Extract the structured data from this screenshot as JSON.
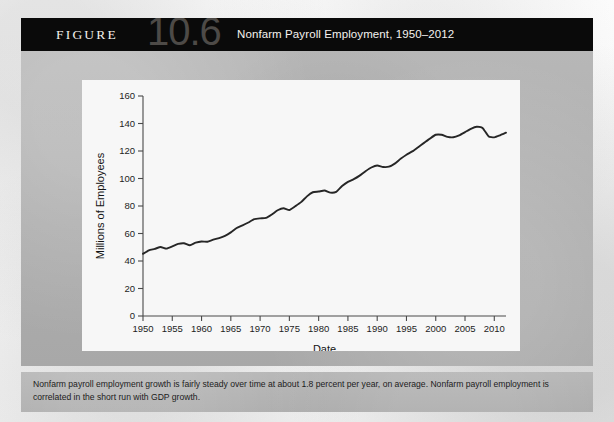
{
  "figure": {
    "label": "FIGURE",
    "number": "10.6",
    "title": "Nonfarm Payroll Employment, 1950–2012",
    "caption": "Nonfarm payroll employment growth is fairly steady over time at about 1.8 percent per year, on average. Nonfarm payroll employment is correlated in the short run with GDP growth.",
    "header_bg": "#0a0a0a",
    "body_bg": "#b0b0b0",
    "panel_bg": "#f7f7f7"
  },
  "chart_data": {
    "type": "line",
    "title": "Nonfarm Payroll Employment, 1950–2012",
    "xlabel": "Date",
    "ylabel": "Millions of Employees",
    "xlim": [
      1950,
      2012
    ],
    "ylim": [
      0,
      160
    ],
    "xticks": [
      1950,
      1955,
      1960,
      1965,
      1970,
      1975,
      1980,
      1985,
      1990,
      1995,
      2000,
      2005,
      2010
    ],
    "yticks": [
      0,
      20,
      40,
      60,
      80,
      100,
      120,
      140,
      160
    ],
    "grid": false,
    "legend": "none",
    "line_color": "#262626",
    "series": [
      {
        "name": "Nonfarm payroll employment",
        "x": [
          1950,
          1951,
          1952,
          1953,
          1954,
          1955,
          1956,
          1957,
          1958,
          1959,
          1960,
          1961,
          1962,
          1963,
          1964,
          1965,
          1966,
          1967,
          1968,
          1969,
          1970,
          1971,
          1972,
          1973,
          1974,
          1975,
          1976,
          1977,
          1978,
          1979,
          1980,
          1981,
          1982,
          1983,
          1984,
          1985,
          1986,
          1987,
          1988,
          1989,
          1990,
          1991,
          1992,
          1993,
          1994,
          1995,
          1996,
          1997,
          1998,
          1999,
          2000,
          2001,
          2002,
          2003,
          2004,
          2005,
          2006,
          2007,
          2008,
          2009,
          2010,
          2011,
          2012
        ],
        "values": [
          45.2,
          47.8,
          48.8,
          50.2,
          49.0,
          50.6,
          52.4,
          52.9,
          51.4,
          53.3,
          54.2,
          54.0,
          55.5,
          56.7,
          58.3,
          60.8,
          64.0,
          65.9,
          68.0,
          70.4,
          71.0,
          71.3,
          73.8,
          76.9,
          78.4,
          77.1,
          79.8,
          82.8,
          87.0,
          90.0,
          90.5,
          91.3,
          89.7,
          90.3,
          94.5,
          97.5,
          99.5,
          102.1,
          105.3,
          108.0,
          109.5,
          108.4,
          108.6,
          110.8,
          114.3,
          117.3,
          119.7,
          122.8,
          125.9,
          129.0,
          131.8,
          131.8,
          130.3,
          130.0,
          131.4,
          133.7,
          136.1,
          137.6,
          136.8,
          130.8,
          129.9,
          131.4,
          133.3
        ]
      }
    ]
  }
}
